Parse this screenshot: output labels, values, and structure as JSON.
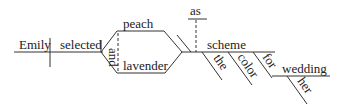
{
  "diagram": {
    "type": "sentence-diagram",
    "sentence": "Emily selected peach and lavender as the color scheme for her wedding",
    "words": {
      "subject": "Emily",
      "verb": "selected",
      "object_1": "peach",
      "conjunction": "and",
      "object_2": "lavender",
      "connector": "as",
      "complement": "scheme",
      "mod_the": "the",
      "mod_color": "color",
      "preposition": "for",
      "prep_object": "wedding",
      "mod_her": "her"
    },
    "colors": {
      "line": "#333333",
      "text": "#222222",
      "background": "#ffffff"
    }
  }
}
